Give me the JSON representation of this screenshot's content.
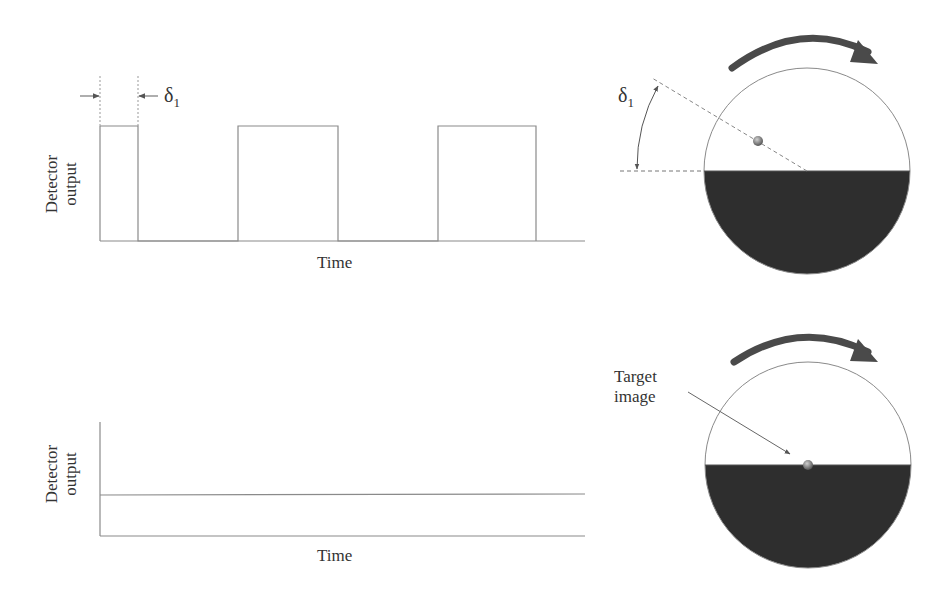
{
  "top_panel": {
    "y_axis_label_line1": "Detector",
    "y_axis_label_line2": "output",
    "x_axis_label": "Time",
    "delta_symbol": "δ",
    "delta_subscript": "1",
    "waveform": "square pulses",
    "pulses": [
      {
        "start_x": 100,
        "end_x": 138
      },
      {
        "start_x": 238,
        "end_x": 338
      },
      {
        "start_x": 438,
        "end_x": 536
      }
    ]
  },
  "top_reticle": {
    "angle_label_symbol": "δ",
    "angle_label_subscript": "1",
    "rotation": "clockwise",
    "target_position": "offset from center, in transparent half"
  },
  "bottom_panel": {
    "y_axis_label_line1": "Detector",
    "y_axis_label_line2": "output",
    "x_axis_label": "Time",
    "waveform": "constant level"
  },
  "bottom_reticle": {
    "callout_line1": "Target",
    "callout_line2": "image",
    "rotation": "clockwise",
    "target_position": "at center"
  },
  "colors": {
    "line": "#8a8a8a",
    "dark_half": "#2e2e2e",
    "arrow": "#4a4a4a",
    "text": "#333333"
  }
}
